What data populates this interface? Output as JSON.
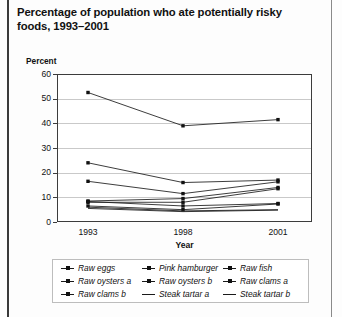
{
  "title": "Percentage of population who ate potentially risky foods, 1993–2001",
  "axis": {
    "y_unit_label": "Percent",
    "x_title": "Year",
    "y_ticks": [
      "60",
      "50",
      "40",
      "30",
      "20",
      "10",
      "0"
    ],
    "x_ticks": [
      "1993",
      "1998",
      "2001"
    ]
  },
  "legend": {
    "items": [
      {
        "label": "Raw eggs",
        "marker": "line-dot"
      },
      {
        "label": "Pink hamburger",
        "marker": "line-dot"
      },
      {
        "label": "Raw fish",
        "marker": "line-dot"
      },
      {
        "label": "Raw oysters a",
        "marker": "line-dot"
      },
      {
        "label": "Raw oysters b",
        "marker": "line-dot"
      },
      {
        "label": "Raw clams a",
        "marker": "line-dot"
      },
      {
        "label": "Raw clams b",
        "marker": "line-dot"
      },
      {
        "label": "Steak tartar a",
        "marker": "line"
      },
      {
        "label": "Steak tartar b",
        "marker": "line"
      }
    ]
  },
  "chart_data": {
    "type": "line",
    "title": "Percentage of population who ate potentially risky foods, 1993–2001",
    "xlabel": "Year",
    "ylabel": "Percent",
    "categories": [
      "1993",
      "1998",
      "2001"
    ],
    "x": [
      1993,
      1998,
      2001
    ],
    "ylim": [
      0,
      60
    ],
    "yticks": [
      0,
      10,
      20,
      30,
      40,
      50,
      60
    ],
    "grid": true,
    "legend_position": "bottom",
    "series": [
      {
        "name": "Raw eggs",
        "values": [
          52.5,
          39.0,
          41.5
        ]
      },
      {
        "name": "Pink hamburger",
        "values": [
          24.0,
          16.0,
          17.0
        ]
      },
      {
        "name": "Raw fish",
        "values": [
          16.5,
          11.5,
          16.3
        ]
      },
      {
        "name": "Raw oysters a",
        "values": [
          8.5,
          9.5,
          14.0
        ]
      },
      {
        "name": "Raw oysters b",
        "values": [
          8.0,
          8.0,
          13.5
        ]
      },
      {
        "name": "Raw clams a",
        "values": [
          8.3,
          6.5,
          7.5
        ]
      },
      {
        "name": "Raw clams b",
        "values": [
          6.5,
          5.0,
          7.3
        ]
      },
      {
        "name": "Steak tartar a",
        "values": [
          6.0,
          4.5,
          5.0
        ]
      },
      {
        "name": "Steak tartar b",
        "values": [
          5.5,
          4.2,
          4.8
        ]
      }
    ]
  }
}
